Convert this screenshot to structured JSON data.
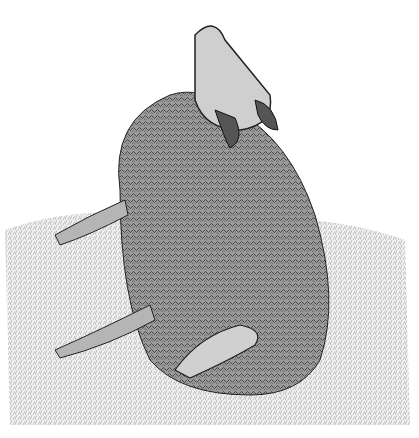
{
  "image": {
    "description": "Pen-and-ink stipple illustration of a sheep lying on grass with its head raised toward the sky",
    "subject": "sheep",
    "style": "black and white crosshatch drawing"
  }
}
